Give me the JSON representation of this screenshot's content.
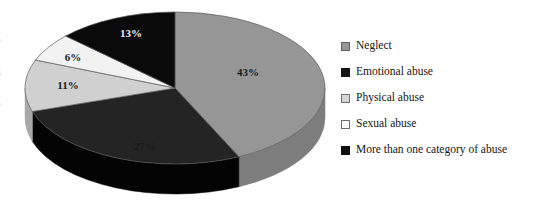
{
  "chart_data": {
    "type": "pie",
    "title": "",
    "subtitle": "",
    "xlabel": "",
    "ylabel": "",
    "grid": false,
    "three_d": true,
    "legend_position": "right",
    "units": "percent",
    "categories": [
      "Neglect",
      "Emotional abuse",
      "Physical abuse",
      "Sexual abuse",
      "More than one category of abuse"
    ],
    "values": [
      43,
      27,
      11,
      6,
      13
    ],
    "labels": [
      "43%",
      "27%",
      "11%",
      "6%",
      "13%"
    ],
    "colors": [
      "#969696",
      "#242424",
      "#d0d0d0",
      "#f2f2f2",
      "#0a0a0a"
    ],
    "side_colors": [
      "#7d7d7d",
      "#040404",
      "#a8a8a8",
      "#cfcfcf",
      "#000000"
    ],
    "label_text_colors": [
      "#1a1a1a",
      "#1a1a1a",
      "#1a1a1a",
      "#1a1a1a",
      "#f4f4f4"
    ],
    "slices": [
      {
        "name": "Neglect",
        "value": 43,
        "label": "43%",
        "color": "#969696",
        "side_color": "#7d7d7d",
        "label_color": "dark",
        "label_x": 248,
        "label_y": 72
      },
      {
        "name": "Emotional abuse",
        "value": 27,
        "label": "27%",
        "color": "#242424",
        "side_color": "#040404",
        "label_color": "dark",
        "label_x": 145,
        "label_y": 146
      },
      {
        "name": "Physical abuse",
        "value": 11,
        "label": "11%",
        "color": "#d0d0d0",
        "side_color": "#a8a8a8",
        "label_color": "dark",
        "label_x": 68,
        "label_y": 85
      },
      {
        "name": "Sexual abuse",
        "value": 6,
        "label": "6%",
        "color": "#f2f2f2",
        "side_color": "#cfcfcf",
        "label_color": "dark",
        "label_x": 73,
        "label_y": 57
      },
      {
        "name": "More than one category of abuse",
        "value": 13,
        "label": "13%",
        "color": "#0a0a0a",
        "side_color": "#000000",
        "label_color": "light",
        "label_x": 131,
        "label_y": 33
      }
    ]
  },
  "legend": {
    "items": [
      {
        "label": "Neglect",
        "swatch": "#969696",
        "swatch_border": "#5e5e5e"
      },
      {
        "label": "Emotional abuse",
        "swatch": "#141414",
        "swatch_border": "#141414"
      },
      {
        "label": "Physical abuse",
        "swatch": "#d4d4d4",
        "swatch_border": "#707070"
      },
      {
        "label": "Sexual abuse",
        "swatch": "#fdfdfd",
        "swatch_border": "#6d6d6d"
      },
      {
        "label": "More than one category of abuse",
        "swatch": "#101010",
        "swatch_border": "#101010"
      }
    ]
  },
  "margin_fragments": [
    "n",
    "g",
    "n"
  ]
}
